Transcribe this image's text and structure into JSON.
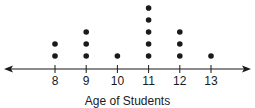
{
  "chart_data": {
    "type": "scatter",
    "subtype": "dot-plot",
    "title": "",
    "xlabel": "Age of Students",
    "ylabel": "",
    "categories": [
      "8",
      "9",
      "10",
      "11",
      "12",
      "13"
    ],
    "x": [
      8,
      9,
      10,
      11,
      12,
      13
    ],
    "values": [
      2,
      3,
      1,
      5,
      3,
      1
    ],
    "xlim": [
      7.5,
      13.5
    ],
    "grid": false,
    "legend": null
  },
  "colors": {
    "ink": "#1a1a1a",
    "background": "#ffffff"
  }
}
